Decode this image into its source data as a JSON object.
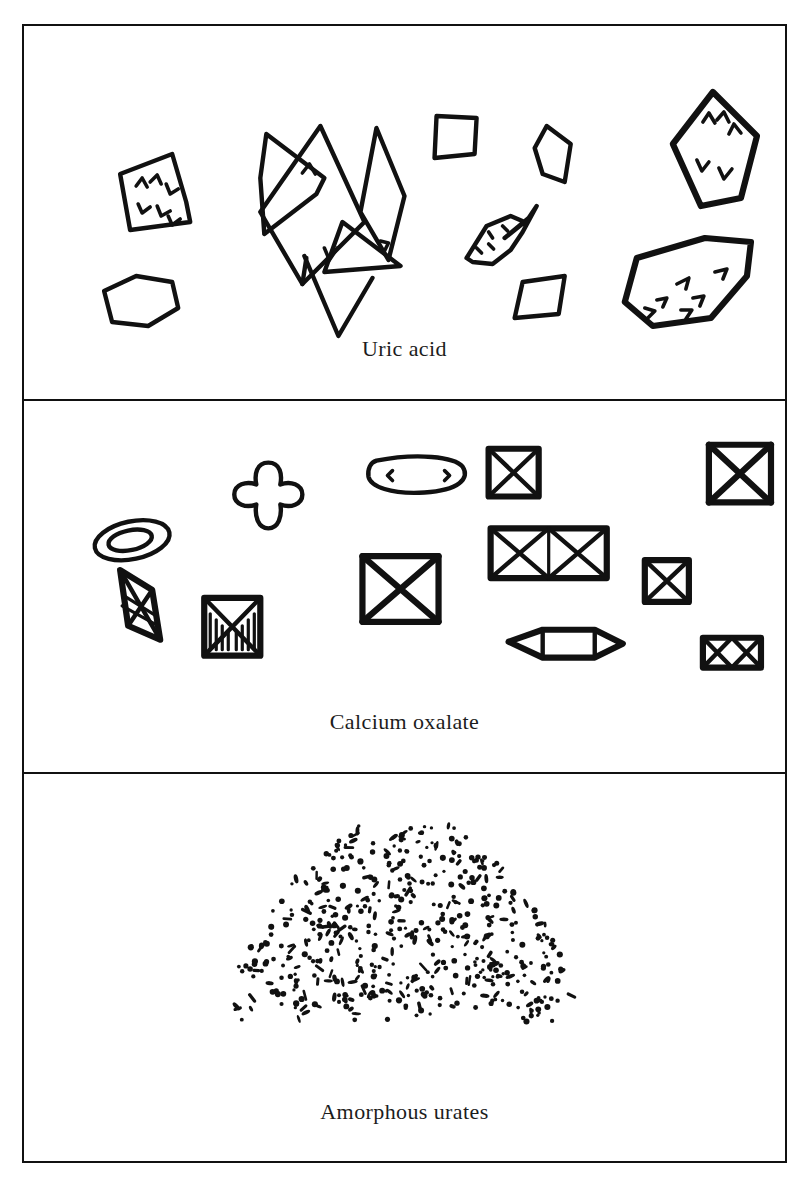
{
  "figure": {
    "cut_off_header_text": "Urine sediment crystals",
    "background_color": "#ffffff",
    "ink_color": "#111111",
    "frame": {
      "border_width_px": 2.5,
      "x": 22,
      "y": 24,
      "width": 765,
      "height": 1139
    },
    "panel_count": 3
  },
  "panels": [
    {
      "id": "uric-acid",
      "caption": "Uric acid",
      "description": "Hand-drawn uric acid crystals: rhomboid plates, four-sided diamonds, a hexagonal plate, an overlapping rosette cluster of pointed wedge crystals, and irregular plates with internal tick marks.",
      "object_count": 9,
      "shapes": [
        "rhomboid-plate-with-ticks",
        "hexagonal-plate",
        "rosette-cluster-overlapping-wedges",
        "small-quadrilateral-plate",
        "narrow-diamond-plate",
        "large-diamond-with-ticks",
        "spindle-rosette-with-dots",
        "small-rhomboid-plate",
        "large-irregular-plate-with-ticks"
      ]
    },
    {
      "id": "calcium-oxalate",
      "caption": "Calcium oxalate",
      "description": "Hand-drawn calcium oxalate crystals: classic envelope (octahedral) squares bisected by an X, plus oval and dumbbell monohydrate forms.",
      "object_count": 12,
      "shapes": [
        "concentric-oval",
        "dumbbell-cross-form",
        "rounded-rod-oval",
        "small-envelope-square",
        "large-envelope-square",
        "twin-envelope-rectangle",
        "octahedral-bipyramid",
        "envelope-with-vertical-striations",
        "large-envelope-square-center",
        "medium-envelope-square",
        "elongated-hexagonal-prism",
        "small-twin-envelope-rectangle"
      ]
    },
    {
      "id": "amorphous-urates",
      "caption": "Amorphous urates",
      "description": "A dense mound-shaped cluster of fine black granules representing amorphous urate sediment.",
      "granule_count_approx": 520,
      "cluster_shape": "dome-mound"
    }
  ],
  "chart_data": {
    "type": "table",
    "categories": [
      "Uric acid",
      "Calcium oxalate",
      "Amorphous urates"
    ],
    "values": [
      9,
      12,
      520
    ],
    "xlabel": "Crystal type",
    "ylabel": "Depicted particle count",
    "legend": [
      "Uric acid",
      "Calcium oxalate",
      "Amorphous urates"
    ],
    "annotations": [
      "Uric acid: rhomboid, diamond, hexagonal and rosette plates",
      "Calcium oxalate: envelope-shaped octahedra, ovals and dumbbells",
      "Amorphous urates: fine granular precipitate"
    ],
    "grid": false,
    "legend_position": "below each panel"
  }
}
